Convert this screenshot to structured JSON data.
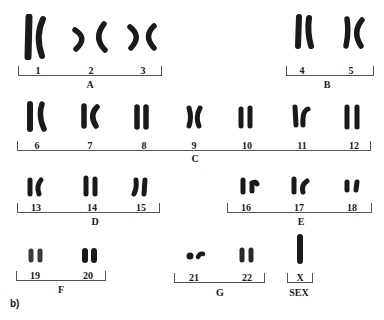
{
  "figure": {
    "panel_label": "b)",
    "groups": [
      {
        "label": "A",
        "chromosomes": [
          "1",
          "2",
          "3"
        ]
      },
      {
        "label": "B",
        "chromosomes": [
          "4",
          "5"
        ]
      },
      {
        "label": "C",
        "chromosomes": [
          "6",
          "7",
          "8",
          "9",
          "10",
          "11",
          "12"
        ]
      },
      {
        "label": "D",
        "chromosomes": [
          "13",
          "14",
          "15"
        ]
      },
      {
        "label": "E",
        "chromosomes": [
          "16",
          "17",
          "18"
        ]
      },
      {
        "label": "F",
        "chromosomes": [
          "19",
          "20"
        ]
      },
      {
        "label": "G",
        "chromosomes": [
          "21",
          "22"
        ]
      },
      {
        "label": "SEX",
        "chromosomes": [
          "X"
        ]
      }
    ],
    "chromosome_color": "#1a1a1a",
    "bracket_color": "#555555"
  }
}
